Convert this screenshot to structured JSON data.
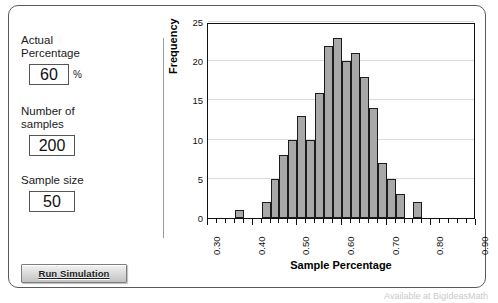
{
  "app": {
    "title": "Sample Percentage Simulation"
  },
  "controls": {
    "actual_percentage": {
      "label_line1": "Actual",
      "label_line2": "Percentage",
      "value": "60",
      "unit": "%"
    },
    "number_of_samples": {
      "label_line1": "Number of",
      "label_line2": "samples",
      "value": "200"
    },
    "sample_size": {
      "label": "Sample size",
      "value": "50"
    },
    "run_button_label": "Run Simulation"
  },
  "footer": {
    "text": "Available at BigIdeasMath"
  },
  "chart_data": {
    "type": "bar",
    "title": "",
    "xlabel": "Sample Percentage",
    "ylabel": "Frequency",
    "ylim": [
      0,
      25
    ],
    "xlim": [
      0.3,
      0.9
    ],
    "grid": true,
    "legend": "none",
    "bin_width": 0.02,
    "ytick_labels": [
      "0",
      "5",
      "10",
      "15",
      "20",
      "25"
    ],
    "ytick_values": [
      0,
      5,
      10,
      15,
      20,
      25
    ],
    "xtick_labels": [
      "0.30",
      "0.40",
      "0.50",
      "0.60",
      "0.70",
      "0.80",
      "0.90"
    ],
    "xtick_values": [
      0.3,
      0.4,
      0.5,
      0.6,
      0.7,
      0.8,
      0.9
    ],
    "xminor_step": 0.02,
    "bins": [
      {
        "x0": 0.3,
        "x1": 0.32,
        "value": 0
      },
      {
        "x0": 0.32,
        "x1": 0.34,
        "value": 0
      },
      {
        "x0": 0.34,
        "x1": 0.36,
        "value": 0
      },
      {
        "x0": 0.36,
        "x1": 0.38,
        "value": 1
      },
      {
        "x0": 0.38,
        "x1": 0.4,
        "value": 0
      },
      {
        "x0": 0.4,
        "x1": 0.42,
        "value": 0
      },
      {
        "x0": 0.42,
        "x1": 0.44,
        "value": 2
      },
      {
        "x0": 0.44,
        "x1": 0.46,
        "value": 5
      },
      {
        "x0": 0.46,
        "x1": 0.48,
        "value": 8
      },
      {
        "x0": 0.48,
        "x1": 0.5,
        "value": 10
      },
      {
        "x0": 0.5,
        "x1": 0.52,
        "value": 13
      },
      {
        "x0": 0.52,
        "x1": 0.54,
        "value": 10
      },
      {
        "x0": 0.54,
        "x1": 0.56,
        "value": 16
      },
      {
        "x0": 0.56,
        "x1": 0.58,
        "value": 22
      },
      {
        "x0": 0.58,
        "x1": 0.6,
        "value": 23
      },
      {
        "x0": 0.6,
        "x1": 0.62,
        "value": 20
      },
      {
        "x0": 0.62,
        "x1": 0.64,
        "value": 21
      },
      {
        "x0": 0.64,
        "x1": 0.66,
        "value": 18
      },
      {
        "x0": 0.66,
        "x1": 0.68,
        "value": 14
      },
      {
        "x0": 0.68,
        "x1": 0.7,
        "value": 7
      },
      {
        "x0": 0.7,
        "x1": 0.72,
        "value": 5
      },
      {
        "x0": 0.72,
        "x1": 0.74,
        "value": 3
      },
      {
        "x0": 0.74,
        "x1": 0.76,
        "value": 0
      },
      {
        "x0": 0.76,
        "x1": 0.78,
        "value": 2
      },
      {
        "x0": 0.78,
        "x1": 0.8,
        "value": 0
      },
      {
        "x0": 0.8,
        "x1": 0.82,
        "value": 0
      },
      {
        "x0": 0.82,
        "x1": 0.84,
        "value": 0
      },
      {
        "x0": 0.84,
        "x1": 0.86,
        "value": 0
      },
      {
        "x0": 0.86,
        "x1": 0.88,
        "value": 0
      },
      {
        "x0": 0.88,
        "x1": 0.9,
        "value": 0
      }
    ]
  },
  "colors": {
    "bar_fill": "#a8a8a8",
    "bar_stroke": "#1c1c1c",
    "grid": "#dcdcdc",
    "frame": "#5a5a5a"
  }
}
